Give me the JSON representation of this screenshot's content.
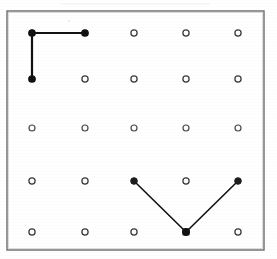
{
  "figure": {
    "description": "A square geoboard frame containing a 5 by 5 array of pegs, with one L-shaped path in the upper left and one V-shaped path in the lower right.",
    "background_color": "#ffffff",
    "ink_color": "#111111",
    "frame_color": "#6b6b6b",
    "peg_fill_color": "#fbfbfb",
    "peg_stroke_color": "#3a3a3a"
  },
  "frame": {
    "x": 7,
    "y": 11,
    "width": 257,
    "height": 239,
    "stroke_width": 1.4
  },
  "grid": {
    "rows": 5,
    "columns": 5,
    "peg_count": 25,
    "column_x": [
      32,
      85,
      134,
      186,
      238
    ],
    "row_y": [
      33,
      79,
      128,
      181,
      232
    ],
    "peg_radius": 3.1,
    "peg_inner_radius": 1.15,
    "connected_peg_radius": 3.3
  },
  "pegs": [
    {
      "id": "peg-r0-c0",
      "row": 0,
      "col": 0,
      "x": 32,
      "y": 33,
      "state": "connected"
    },
    {
      "id": "peg-r0-c1",
      "row": 0,
      "col": 1,
      "x": 85,
      "y": 33,
      "state": "connected"
    },
    {
      "id": "peg-r0-c2",
      "row": 0,
      "col": 2,
      "x": 134,
      "y": 33,
      "state": "free"
    },
    {
      "id": "peg-r0-c3",
      "row": 0,
      "col": 3,
      "x": 186,
      "y": 33,
      "state": "free"
    },
    {
      "id": "peg-r0-c4",
      "row": 0,
      "col": 4,
      "x": 238,
      "y": 33,
      "state": "free"
    },
    {
      "id": "peg-r1-c0",
      "row": 1,
      "col": 0,
      "x": 32,
      "y": 79,
      "state": "connected"
    },
    {
      "id": "peg-r1-c1",
      "row": 1,
      "col": 1,
      "x": 85,
      "y": 79,
      "state": "free"
    },
    {
      "id": "peg-r1-c2",
      "row": 1,
      "col": 2,
      "x": 134,
      "y": 79,
      "state": "free"
    },
    {
      "id": "peg-r1-c3",
      "row": 1,
      "col": 3,
      "x": 186,
      "y": 79,
      "state": "free"
    },
    {
      "id": "peg-r1-c4",
      "row": 1,
      "col": 4,
      "x": 238,
      "y": 79,
      "state": "free"
    },
    {
      "id": "peg-r2-c0",
      "row": 2,
      "col": 0,
      "x": 32,
      "y": 128,
      "state": "free"
    },
    {
      "id": "peg-r2-c1",
      "row": 2,
      "col": 1,
      "x": 85,
      "y": 128,
      "state": "free"
    },
    {
      "id": "peg-r2-c2",
      "row": 2,
      "col": 2,
      "x": 134,
      "y": 128,
      "state": "free"
    },
    {
      "id": "peg-r2-c3",
      "row": 2,
      "col": 3,
      "x": 186,
      "y": 128,
      "state": "free"
    },
    {
      "id": "peg-r2-c4",
      "row": 2,
      "col": 4,
      "x": 238,
      "y": 128,
      "state": "free"
    },
    {
      "id": "peg-r3-c0",
      "row": 3,
      "col": 0,
      "x": 32,
      "y": 181,
      "state": "free"
    },
    {
      "id": "peg-r3-c1",
      "row": 3,
      "col": 1,
      "x": 85,
      "y": 181,
      "state": "free"
    },
    {
      "id": "peg-r3-c2",
      "row": 3,
      "col": 2,
      "x": 134,
      "y": 181,
      "state": "connected"
    },
    {
      "id": "peg-r3-c3",
      "row": 3,
      "col": 3,
      "x": 186,
      "y": 181,
      "state": "free"
    },
    {
      "id": "peg-r3-c4",
      "row": 3,
      "col": 4,
      "x": 238,
      "y": 181,
      "state": "connected"
    },
    {
      "id": "peg-r4-c0",
      "row": 4,
      "col": 0,
      "x": 32,
      "y": 232,
      "state": "free"
    },
    {
      "id": "peg-r4-c1",
      "row": 4,
      "col": 1,
      "x": 85,
      "y": 232,
      "state": "free"
    },
    {
      "id": "peg-r4-c2",
      "row": 4,
      "col": 2,
      "x": 134,
      "y": 232,
      "state": "free"
    },
    {
      "id": "peg-r4-c3",
      "row": 4,
      "col": 3,
      "x": 186,
      "y": 232,
      "state": "connected"
    },
    {
      "id": "peg-r4-c4",
      "row": 4,
      "col": 4,
      "x": 238,
      "y": 232,
      "state": "free"
    }
  ],
  "paths": [
    {
      "id": "path-l-shape",
      "name": "L-shaped path",
      "stroke_width": 2.2,
      "segment_count": 2,
      "points_grid": [
        [
          1,
          0
        ],
        [
          0,
          0
        ],
        [
          0,
          1
        ]
      ],
      "points_px": [
        [
          85,
          33
        ],
        [
          32,
          33
        ],
        [
          32,
          79
        ]
      ],
      "polyline": "85,33 32,33 32,79"
    },
    {
      "id": "path-v-shape",
      "name": "V-shaped path",
      "stroke_width": 1.6,
      "segment_count": 2,
      "points_grid": [
        [
          2,
          3
        ],
        [
          3,
          4
        ],
        [
          4,
          3
        ]
      ],
      "points_px": [
        [
          134,
          181
        ],
        [
          186,
          232
        ],
        [
          238,
          181
        ]
      ],
      "polyline": "134,181 186,232 238,181"
    }
  ]
}
